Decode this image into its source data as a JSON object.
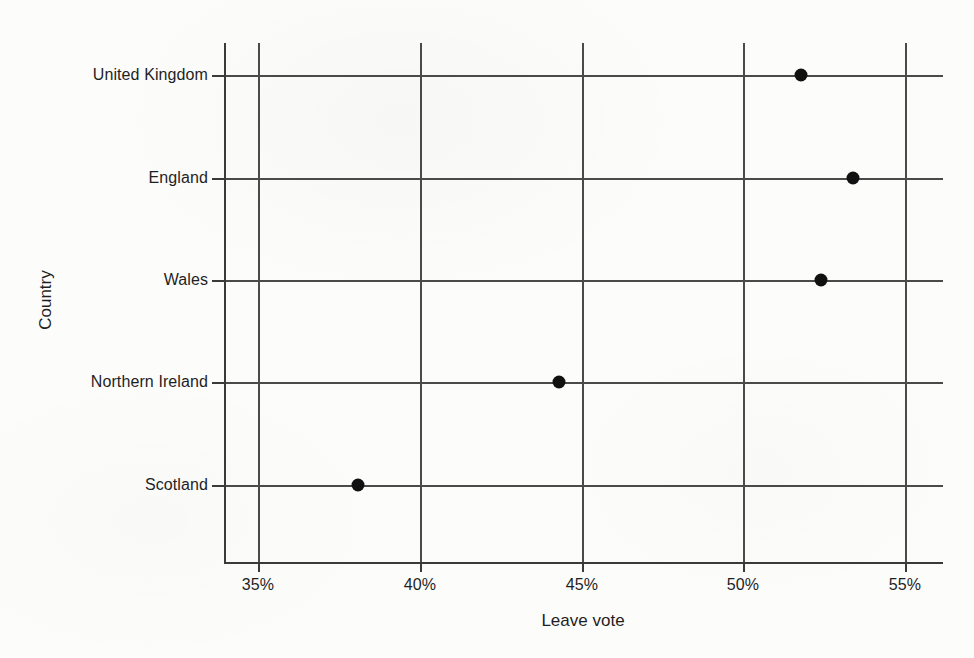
{
  "chart_data": {
    "type": "scatter",
    "title": "",
    "xlabel": "Leave vote",
    "ylabel": "Country",
    "categories": [
      "United Kingdom",
      "England",
      "Wales",
      "Northern Ireland",
      "Scotland"
    ],
    "values": [
      51.8,
      53.4,
      52.4,
      44.3,
      38.1
    ],
    "series": [
      {
        "name": "Leave vote",
        "points": [
          {
            "category": "United Kingdom",
            "value": 51.8
          },
          {
            "category": "England",
            "value": 53.4
          },
          {
            "category": "Wales",
            "value": 52.4
          },
          {
            "category": "Northern Ireland",
            "value": 44.3
          },
          {
            "category": "Scotland",
            "value": 38.1
          }
        ]
      }
    ],
    "xlim": [
      33.8,
      56.2
    ],
    "x_ticks": [
      35,
      40,
      45,
      50,
      55
    ],
    "x_tick_labels": [
      "35%",
      "40%",
      "45%",
      "50%",
      "55%"
    ],
    "y_tick_labels": [
      "United Kingdom",
      "England",
      "Wales",
      "Northern Ireland",
      "Scotland"
    ],
    "grid": "both",
    "legend": "none",
    "marker": "filled-circle",
    "marker_color": "#111111",
    "grid_color": "#4a4a4a",
    "background_color": "#fcfcfb"
  }
}
